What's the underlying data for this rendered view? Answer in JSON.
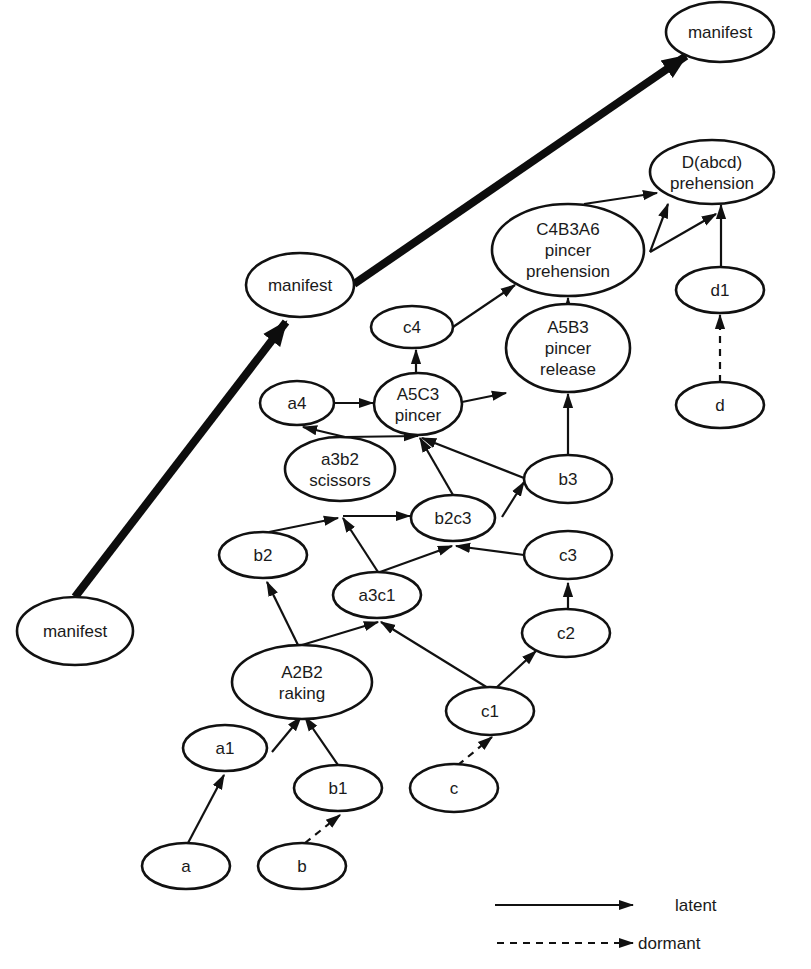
{
  "diagram": {
    "type": "directed-graph",
    "colors": {
      "stroke": "#111111",
      "background": "#ffffff",
      "text": "#1a1a1a"
    },
    "nodes": [
      {
        "id": "manifest_top",
        "lines": [
          "manifest"
        ],
        "cx": 720,
        "cy": 32,
        "rx": 54,
        "ry": 30
      },
      {
        "id": "Dabcd",
        "lines": [
          "D(abcd)",
          "prehension"
        ],
        "cx": 712,
        "cy": 172,
        "rx": 62,
        "ry": 32
      },
      {
        "id": "manifest_mid",
        "lines": [
          "manifest"
        ],
        "cx": 300,
        "cy": 285,
        "rx": 54,
        "ry": 32
      },
      {
        "id": "C4B3A6",
        "lines": [
          "C4B3A6",
          "pincer",
          "prehension"
        ],
        "cx": 568,
        "cy": 250,
        "rx": 76,
        "ry": 46
      },
      {
        "id": "d1",
        "lines": [
          "d1"
        ],
        "cx": 720,
        "cy": 290,
        "rx": 44,
        "ry": 23
      },
      {
        "id": "c4",
        "lines": [
          "c4"
        ],
        "cx": 412,
        "cy": 327,
        "rx": 41,
        "ry": 21
      },
      {
        "id": "A5B3",
        "lines": [
          "A5B3",
          "pincer",
          "release"
        ],
        "cx": 568,
        "cy": 348,
        "rx": 62,
        "ry": 44
      },
      {
        "id": "A5C3",
        "lines": [
          "A5C3",
          "pincer"
        ],
        "cx": 418,
        "cy": 404,
        "rx": 44,
        "ry": 31
      },
      {
        "id": "a4",
        "lines": [
          "a4"
        ],
        "cx": 297,
        "cy": 403,
        "rx": 37,
        "ry": 22
      },
      {
        "id": "d",
        "lines": [
          "d"
        ],
        "cx": 720,
        "cy": 405,
        "rx": 44,
        "ry": 23
      },
      {
        "id": "a3b2",
        "lines": [
          "a3b2",
          "scissors"
        ],
        "cx": 340,
        "cy": 469,
        "rx": 55,
        "ry": 32
      },
      {
        "id": "b3",
        "lines": [
          "b3"
        ],
        "cx": 568,
        "cy": 479,
        "rx": 44,
        "ry": 24
      },
      {
        "id": "b2c3",
        "lines": [
          "b2c3"
        ],
        "cx": 453,
        "cy": 518,
        "rx": 42,
        "ry": 23
      },
      {
        "id": "b2",
        "lines": [
          "b2"
        ],
        "cx": 263,
        "cy": 555,
        "rx": 44,
        "ry": 23
      },
      {
        "id": "c3",
        "lines": [
          "c3"
        ],
        "cx": 568,
        "cy": 555,
        "rx": 44,
        "ry": 24
      },
      {
        "id": "a3c1",
        "lines": [
          "a3c1"
        ],
        "cx": 377,
        "cy": 595,
        "rx": 44,
        "ry": 23
      },
      {
        "id": "manifest_left",
        "lines": [
          "manifest"
        ],
        "cx": 75,
        "cy": 631,
        "rx": 58,
        "ry": 34
      },
      {
        "id": "c2",
        "lines": [
          "c2"
        ],
        "cx": 566,
        "cy": 633,
        "rx": 44,
        "ry": 24
      },
      {
        "id": "A2B2",
        "lines": [
          "A2B2",
          "raking"
        ],
        "cx": 302,
        "cy": 682,
        "rx": 70,
        "ry": 37
      },
      {
        "id": "c1",
        "lines": [
          "c1"
        ],
        "cx": 490,
        "cy": 711,
        "rx": 44,
        "ry": 24
      },
      {
        "id": "a1",
        "lines": [
          "a1"
        ],
        "cx": 225,
        "cy": 748,
        "rx": 42,
        "ry": 23
      },
      {
        "id": "b1",
        "lines": [
          "b1"
        ],
        "cx": 338,
        "cy": 788,
        "rx": 44,
        "ry": 23
      },
      {
        "id": "c",
        "lines": [
          "c"
        ],
        "cx": 454,
        "cy": 788,
        "rx": 44,
        "ry": 24
      },
      {
        "id": "a",
        "lines": [
          "a"
        ],
        "cx": 186,
        "cy": 866,
        "rx": 44,
        "ry": 23
      },
      {
        "id": "b",
        "lines": [
          "b"
        ],
        "cx": 302,
        "cy": 866,
        "rx": 44,
        "ry": 23
      }
    ],
    "edges": [
      {
        "from": "manifest_left",
        "to": "manifest_mid",
        "style": "manifest",
        "x1": 75,
        "y1": 597,
        "x2": 286,
        "y2": 322
      },
      {
        "from": "manifest_mid",
        "to": "manifest_top",
        "style": "manifest",
        "x1": 354,
        "y1": 284,
        "x2": 686,
        "y2": 56
      },
      {
        "from": "a",
        "to": "a1",
        "style": "latent",
        "x1": 188,
        "y1": 843,
        "x2": 224,
        "y2": 775
      },
      {
        "from": "b",
        "to": "b1",
        "style": "dormant",
        "x1": 305,
        "y1": 843,
        "x2": 340,
        "y2": 815
      },
      {
        "from": "c",
        "to": "c1",
        "style": "dormant",
        "x1": 458,
        "y1": 765,
        "x2": 492,
        "y2": 737
      },
      {
        "from": "d",
        "to": "d1",
        "style": "dormant",
        "x1": 720,
        "y1": 382,
        "x2": 720,
        "y2": 315
      },
      {
        "from": "a1",
        "to": "A2B2",
        "style": "latent",
        "x1": 272,
        "y1": 752,
        "x2": 301,
        "y2": 717
      },
      {
        "from": "b1",
        "to": "A2B2",
        "style": "latent",
        "x1": 338,
        "y1": 765,
        "x2": 305,
        "y2": 717
      },
      {
        "from": "A2B2",
        "to": "b2",
        "style": "latent",
        "x1": 298,
        "y1": 645,
        "x2": 267,
        "y2": 582
      },
      {
        "from": "A2B2",
        "to": "a3c1",
        "style": "latent",
        "x1": 302,
        "y1": 645,
        "x2": 378,
        "y2": 622
      },
      {
        "from": "c1",
        "to": "a3c1",
        "style": "latent",
        "x1": 488,
        "y1": 688,
        "x2": 381,
        "y2": 622
      },
      {
        "from": "c1",
        "to": "c2",
        "style": "latent",
        "x1": 496,
        "y1": 688,
        "x2": 536,
        "y2": 651
      },
      {
        "from": "c2",
        "to": "c3",
        "style": "latent",
        "x1": 568,
        "y1": 609,
        "x2": 568,
        "y2": 583
      },
      {
        "from": "b2",
        "to": "a3b2",
        "style": "latent",
        "x1": 269,
        "y1": 532,
        "x2": 338,
        "y2": 518
      },
      {
        "from": "a3c1",
        "to": "a3b2",
        "style": "latent",
        "x1": 378,
        "y1": 572,
        "x2": 343,
        "y2": 518
      },
      {
        "from": "a3c1",
        "to": "b2c3",
        "style": "latent",
        "x1": 380,
        "y1": 572,
        "x2": 452,
        "y2": 546
      },
      {
        "from": "c3",
        "to": "b2c3",
        "style": "latent",
        "x1": 524,
        "y1": 555,
        "x2": 456,
        "y2": 546
      },
      {
        "from": "a3b2",
        "to": "b2c3",
        "style": "latent",
        "x1": 343,
        "y1": 516,
        "x2": 410,
        "y2": 516
      },
      {
        "from": "b2c3",
        "to": "b3",
        "style": "latent",
        "x1": 502,
        "y1": 517,
        "x2": 524,
        "y2": 482
      },
      {
        "from": "b2c3",
        "to": "A5C3",
        "style": "latent",
        "x1": 453,
        "y1": 495,
        "x2": 420,
        "y2": 438
      },
      {
        "from": "b3",
        "to": "A5C3",
        "style": "latent",
        "x1": 524,
        "y1": 478,
        "x2": 422,
        "y2": 438
      },
      {
        "from": "b3",
        "to": "A5B3",
        "style": "latent",
        "x1": 568,
        "y1": 455,
        "x2": 568,
        "y2": 394
      },
      {
        "from": "a3b2",
        "to": "A5C3",
        "style": "latent",
        "x1": 345,
        "y1": 437,
        "x2": 418,
        "y2": 436
      },
      {
        "from": "a3b2",
        "to": "a4",
        "style": "latent",
        "x1": 345,
        "y1": 437,
        "x2": 303,
        "y2": 427
      },
      {
        "from": "a4",
        "to": "A5C3",
        "style": "latent",
        "x1": 334,
        "y1": 403,
        "x2": 373,
        "y2": 403
      },
      {
        "from": "A5C3",
        "to": "c4",
        "style": "latent",
        "x1": 416,
        "y1": 373,
        "x2": 416,
        "y2": 350
      },
      {
        "from": "A5C3",
        "to": "A5B3",
        "style": "latent",
        "x1": 462,
        "y1": 402,
        "x2": 506,
        "y2": 393
      },
      {
        "from": "c4",
        "to": "C4B3A6",
        "style": "latent",
        "x1": 453,
        "y1": 327,
        "x2": 515,
        "y2": 285
      },
      {
        "from": "A5B3",
        "to": "C4B3A6",
        "style": "latent",
        "x1": 568,
        "y1": 304,
        "x2": 568,
        "y2": 298
      },
      {
        "from": "C4B3A6",
        "to": "Dabcd",
        "style": "latent",
        "x1": 584,
        "y1": 204,
        "x2": 657,
        "y2": 193
      },
      {
        "from": "C4B3A6",
        "to": "Dabcd",
        "style": "latent",
        "x1": 650,
        "y1": 252,
        "x2": 668,
        "y2": 204
      },
      {
        "from": "C4B3A6",
        "to": "Dabcd",
        "style": "latent",
        "x1": 650,
        "y1": 252,
        "x2": 716,
        "y2": 214
      },
      {
        "from": "d1",
        "to": "Dabcd",
        "style": "latent",
        "x1": 721,
        "y1": 266,
        "x2": 721,
        "y2": 205
      }
    ]
  },
  "legend": {
    "items": [
      {
        "label": "latent",
        "style": "latent"
      },
      {
        "label": "dormant",
        "style": "dormant"
      }
    ]
  }
}
